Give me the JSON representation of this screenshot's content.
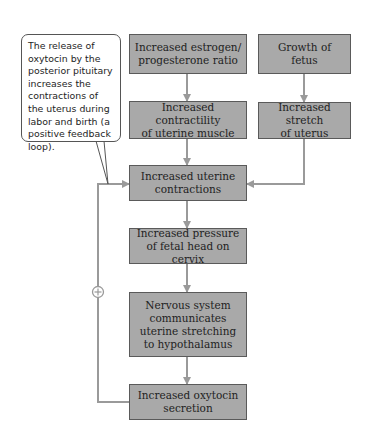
{
  "callout": {
    "text": "The release of oxytocin by the posterior pituitary increases the contractions of the uterus during labor and birth (a positive feedback loop)."
  },
  "nodes": {
    "estrogen": "Increased estrogen/\nprogesterone ratio",
    "growth": "Growth of\nfetus",
    "contractility": "Increased contractility\nof uterine muscle",
    "stretch": "Increased stretch\nof uterus",
    "contractions": "Increased uterine\ncontractions",
    "pressure": "Increased pressure\nof fetal head on cervix",
    "nervous": "Nervous system\ncommunicates\nuterine stretching\nto hypothalamus",
    "oxytocin": "Increased oxytocin\nsecretion"
  },
  "feedback": {
    "symbol": "+",
    "type": "positive feedback loop"
  },
  "colors": {
    "box_fill": "#a9a9a9",
    "box_border": "#5a5a5a",
    "connector": "#9a9a9a"
  }
}
